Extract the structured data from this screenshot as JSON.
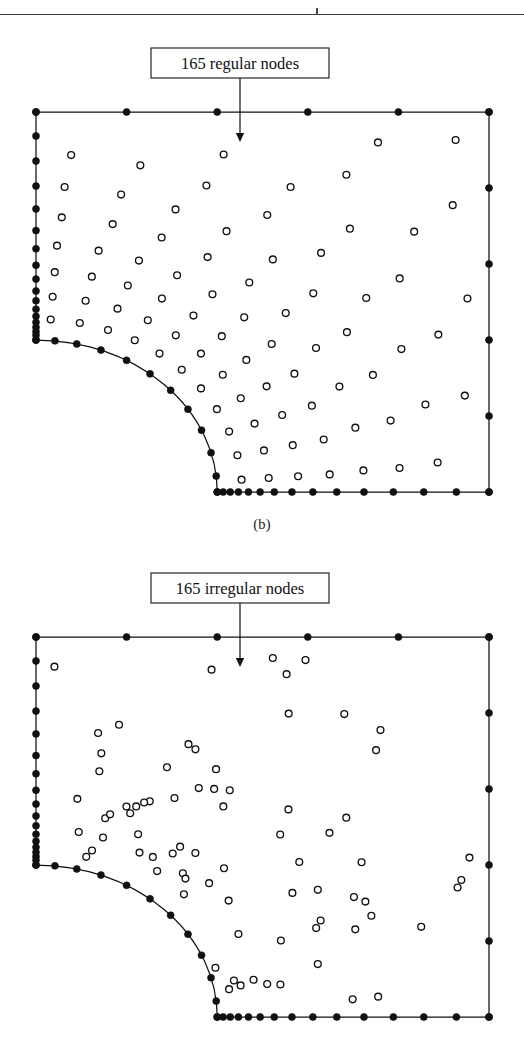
{
  "figure": {
    "caption_b": "(b)",
    "panels": [
      {
        "id": "regular",
        "label": "165 regular nodes",
        "node_count": 165,
        "node_type": "regular",
        "caption": "(b)"
      },
      {
        "id": "irregular",
        "label": "165 irregular nodes",
        "node_count": 165,
        "node_type": "irregular",
        "caption": ""
      }
    ]
  },
  "chart_data": {
    "type": "scatter",
    "title": "",
    "xlabel": "",
    "ylabel": "",
    "grid": false,
    "legend": null,
    "panels": [
      {
        "name": "165 regular nodes",
        "annotation": "165 regular nodes",
        "annotation_arrow": "down",
        "interior_marker": "open-circle",
        "boundary_marker": "filled-dot",
        "interior_count": 112,
        "boundary_count": 53,
        "total_nodes": 165,
        "layout": "structured radial arcs emanating from the quarter-circle notch, graded finer near the arc"
      },
      {
        "name": "165 irregular nodes",
        "annotation": "165 irregular nodes",
        "annotation_arrow": "down",
        "interior_marker": "open-circle",
        "boundary_marker": "filled-dot",
        "interior_count": 112,
        "boundary_count": 53,
        "total_nodes": 165,
        "layout": "randomly perturbed scatter, density increasing toward the quarter-circle notch"
      }
    ],
    "domain": {
      "shape": "unit square with quarter-circle notch at lower-left",
      "x_range": [
        0,
        1
      ],
      "y_range": [
        0,
        1
      ],
      "notch_radius": 0.4,
      "notch_center": [
        0,
        0
      ]
    },
    "boundary_nodes": {
      "top_edge_t": [
        0.0,
        0.2,
        0.4,
        0.6,
        0.8,
        1.0
      ],
      "right_edge_t": [
        0.0,
        0.2,
        0.4,
        0.6,
        0.8,
        1.0
      ],
      "bottom_edge_t": [
        0.0,
        0.022,
        0.048,
        0.078,
        0.115,
        0.158,
        0.21,
        0.275,
        0.352,
        0.44,
        0.54,
        0.648,
        0.76,
        0.88,
        1.0
      ],
      "left_edge_t": [
        0.0,
        0.105,
        0.215,
        0.325,
        0.425,
        0.52,
        0.6,
        0.672,
        0.733,
        0.785,
        0.828,
        0.865,
        0.896,
        0.922,
        0.944,
        0.963,
        0.979,
        1.0
      ],
      "arc_angles_deg": [
        0,
        6,
        13,
        21,
        30,
        39,
        48,
        57,
        66,
        75,
        84,
        90
      ]
    },
    "colors": {
      "stroke": "#111111",
      "fill_boundary": "#111111",
      "fill_interior": "#ffffff",
      "background": "#ffffff",
      "rule": "#3a3a3a"
    }
  }
}
